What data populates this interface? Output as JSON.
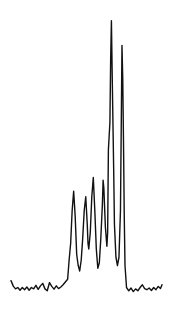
{
  "chart_data": {
    "type": "line",
    "title": "",
    "xlabel": "",
    "ylabel": "",
    "grid": false,
    "legend": "none",
    "xlim": [
      0,
      100
    ],
    "ylim": [
      0,
      100
    ],
    "series": [
      {
        "name": "trace",
        "color": "#111111",
        "points": [
          [
            0,
            4.5
          ],
          [
            1.5,
            2.5
          ],
          [
            3,
            1.5
          ],
          [
            4.5,
            2
          ],
          [
            6,
            1
          ],
          [
            7.5,
            2
          ],
          [
            9,
            1.2
          ],
          [
            10.5,
            2.2
          ],
          [
            12,
            1
          ],
          [
            13.5,
            2
          ],
          [
            15,
            1.5
          ],
          [
            16.5,
            2.8
          ],
          [
            18,
            1.3
          ],
          [
            19.5,
            2.6
          ],
          [
            21,
            3.5
          ],
          [
            22.5,
            1.5
          ],
          [
            24,
            0.8
          ],
          [
            25.5,
            3.8
          ],
          [
            27,
            2.4
          ],
          [
            28.5,
            1.4
          ],
          [
            30,
            2.6
          ],
          [
            31.5,
            1.6
          ],
          [
            33,
            2.2
          ],
          [
            34.5,
            3
          ],
          [
            36,
            4
          ],
          [
            37.5,
            5
          ],
          [
            38.5,
            12
          ],
          [
            39.5,
            18
          ],
          [
            40.5,
            30
          ],
          [
            41.5,
            37
          ],
          [
            42.5,
            28
          ],
          [
            43.5,
            14
          ],
          [
            44.5,
            10
          ],
          [
            45.5,
            8
          ],
          [
            46.5,
            12
          ],
          [
            47.5,
            20
          ],
          [
            48.5,
            30
          ],
          [
            49.5,
            35
          ],
          [
            50.5,
            25
          ],
          [
            51,
            18
          ],
          [
            51.5,
            16
          ],
          [
            52.5,
            22
          ],
          [
            53.5,
            35
          ],
          [
            54.5,
            42
          ],
          [
            55.5,
            30
          ],
          [
            56.5,
            16
          ],
          [
            57.5,
            9
          ],
          [
            58.5,
            11
          ],
          [
            59.5,
            20
          ],
          [
            60.5,
            32
          ],
          [
            61,
            41
          ],
          [
            61.5,
            38
          ],
          [
            62.5,
            24
          ],
          [
            63.5,
            17
          ],
          [
            64,
            22
          ],
          [
            64.5,
            52
          ],
          [
            65.5,
            62
          ],
          [
            66,
            85
          ],
          [
            66.5,
            99
          ],
          [
            67,
            80
          ],
          [
            68,
            45
          ],
          [
            68.5,
            25
          ],
          [
            69.5,
            13
          ],
          [
            70.5,
            10
          ],
          [
            71.5,
            13
          ],
          [
            72.5,
            30
          ],
          [
            73,
            60
          ],
          [
            73.5,
            90
          ],
          [
            74,
            78
          ],
          [
            74.5,
            55
          ],
          [
            75,
            28
          ],
          [
            75.5,
            10
          ],
          [
            76.5,
            2
          ],
          [
            78,
            0.8
          ],
          [
            79.5,
            1.8
          ],
          [
            81,
            0.5
          ],
          [
            82.5,
            1.5
          ],
          [
            84,
            0.8
          ],
          [
            85.5,
            2
          ],
          [
            87,
            3
          ],
          [
            88.5,
            1.6
          ],
          [
            90,
            1.2
          ],
          [
            91.5,
            1.8
          ],
          [
            93,
            0.9
          ],
          [
            94.5,
            2
          ],
          [
            96,
            1.2
          ],
          [
            97.5,
            2.4
          ],
          [
            99,
            1.6
          ],
          [
            100,
            3
          ]
        ]
      }
    ]
  }
}
